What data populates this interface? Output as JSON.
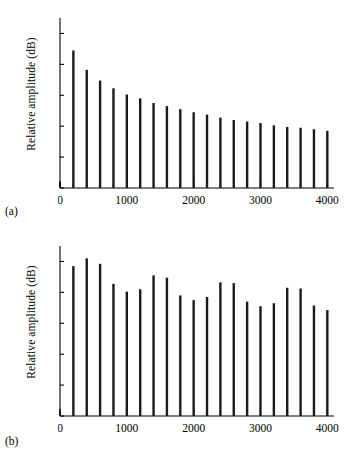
{
  "figure": {
    "panels": [
      {
        "id": "a",
        "sublabel": "(a)",
        "ylabel": "Relative amplitude (dB)"
      },
      {
        "id": "b",
        "sublabel": "(b)",
        "ylabel": "Relative amplitude (dB)"
      }
    ]
  },
  "axis": {
    "x_ticklabels": [
      "0",
      "1000",
      "2000",
      "3000",
      "4000"
    ],
    "x_tickvalues": [
      0,
      1000,
      2000,
      3000,
      4000
    ],
    "y_ticklabels": [
      "0",
      "−20",
      "−40",
      "−60",
      "−80",
      "−100"
    ],
    "y_tickvalues": [
      0,
      -20,
      -40,
      -60,
      -80,
      -100
    ],
    "x_minor_step": 200,
    "xlim": [
      0,
      4100
    ],
    "ylim": [
      -100,
      10
    ],
    "axis_color": "#000000",
    "bar_color": "#1a1a1a"
  },
  "chart_data": [
    {
      "type": "bar",
      "title": "",
      "subtitle": "(a)",
      "xlabel": "",
      "ylabel": "Relative amplitude (dB)",
      "xlim": [
        0,
        4100
      ],
      "ylim": [
        -100,
        10
      ],
      "grid": false,
      "legend": "none",
      "baseline": -100,
      "x": [
        200,
        400,
        600,
        800,
        1000,
        1200,
        1400,
        1600,
        1800,
        2000,
        2200,
        2400,
        2600,
        2800,
        3000,
        3200,
        3400,
        3600,
        3800,
        4000
      ],
      "values": [
        -11,
        -23.5,
        -30.5,
        -35.5,
        -39.5,
        -42,
        -45,
        -47,
        -49,
        -51,
        -52.5,
        -54.5,
        -56,
        -57,
        -58,
        -59.5,
        -60.5,
        -61,
        -62,
        -63
      ],
      "x_ticklabels": [
        "0",
        "1000",
        "2000",
        "3000",
        "4000"
      ],
      "y_ticklabels": [
        "0",
        "−20",
        "−40",
        "−60",
        "−80",
        "−100"
      ]
    },
    {
      "type": "bar",
      "title": "",
      "subtitle": "(b)",
      "xlabel": "",
      "ylabel": "Relative amplitude (dB)",
      "xlim": [
        0,
        4100
      ],
      "ylim": [
        -100,
        10
      ],
      "grid": false,
      "legend": "none",
      "baseline": -100,
      "x": [
        200,
        400,
        600,
        800,
        1000,
        1200,
        1400,
        1600,
        1800,
        2000,
        2200,
        2400,
        2600,
        2800,
        3000,
        3200,
        3400,
        3600,
        3800,
        4000
      ],
      "values": [
        -3,
        2,
        -1.5,
        -14.5,
        -19.5,
        -18,
        -9,
        -10.5,
        -22,
        -25,
        -23,
        -13.5,
        -14,
        -26,
        -29,
        -27,
        -17,
        -17.5,
        -28.5,
        -31.5
      ],
      "x_ticklabels": [
        "0",
        "1000",
        "2000",
        "3000",
        "4000"
      ],
      "y_ticklabels": [
        "0",
        "−20",
        "−40",
        "−60",
        "−80",
        "−100"
      ]
    }
  ]
}
